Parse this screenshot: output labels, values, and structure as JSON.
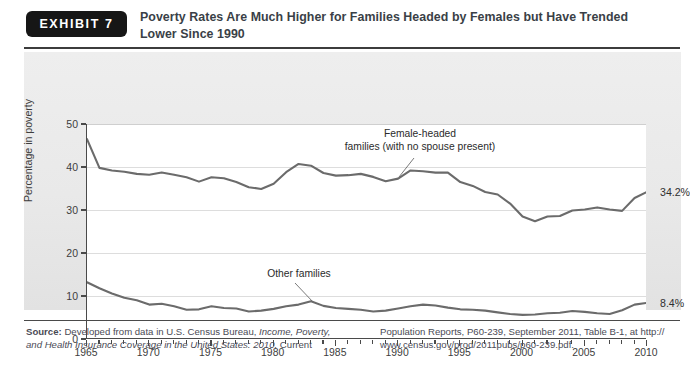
{
  "exhibit": {
    "badge_label": "EXHIBIT 7",
    "title": "Poverty Rates Are Much Higher for Families Headed by Females but Have Trended Lower Since 1990"
  },
  "source": {
    "label": "Source:",
    "left_line1_plain": " Developed from data in U.S. Census Bureau, ",
    "left_line1_italic": "Income, Poverty,",
    "left_line2_italic": "and Health Insurance Coverage in the United States: 2010,",
    "left_line2_plain": " Current",
    "right_line1": "Population Reports, P60-239, September 2011, Table B-1, at http://",
    "right_line2": "www.census.gov/prod/2011pubs/p60-239.pdf."
  },
  "chart_data": {
    "type": "line",
    "title": "Poverty Rates Are Much Higher for Families Headed by Females but Have Trended Lower Since 1990",
    "xlabel": "",
    "ylabel": "Percentage in poverty",
    "xlim": [
      1965,
      2010
    ],
    "ylim": [
      0,
      50
    ],
    "yticks": [
      0,
      10,
      20,
      30,
      40,
      50
    ],
    "xticks": [
      1965,
      1970,
      1975,
      1980,
      1985,
      1990,
      1995,
      2000,
      2005,
      2010
    ],
    "x_minor_step": 1,
    "grid": true,
    "legend": "none",
    "line_color": "#6b6b6b",
    "x": [
      1965,
      1966,
      1967,
      1968,
      1969,
      1970,
      1971,
      1972,
      1973,
      1974,
      1975,
      1976,
      1977,
      1978,
      1979,
      1980,
      1981,
      1982,
      1983,
      1984,
      1985,
      1986,
      1987,
      1988,
      1989,
      1990,
      1991,
      1992,
      1993,
      1994,
      1995,
      1996,
      1997,
      1998,
      1999,
      2000,
      2001,
      2002,
      2003,
      2004,
      2005,
      2006,
      2007,
      2008,
      2009,
      2010
    ],
    "series": [
      {
        "name": "Female-headed families (with no spouse present)",
        "annotation": "Female-headed\nfamilies (with no spouse present)",
        "end_label": "34.2%",
        "values": [
          46.5,
          39.8,
          39.2,
          38.9,
          38.4,
          38.2,
          38.7,
          38.2,
          37.6,
          36.6,
          37.6,
          37.4,
          36.5,
          35.3,
          34.9,
          36.1,
          38.8,
          40.7,
          40.3,
          38.6,
          38.0,
          38.1,
          38.4,
          37.7,
          36.7,
          37.3,
          39.2,
          39.0,
          38.7,
          38.7,
          36.5,
          35.6,
          34.2,
          33.6,
          31.5,
          28.5,
          27.4,
          28.5,
          28.6,
          29.9,
          30.1,
          30.6,
          30.1,
          29.8,
          32.8,
          34.2
        ]
      },
      {
        "name": "Other families",
        "annotation": "Other families",
        "end_label": "8.4%",
        "values": [
          13.2,
          11.8,
          10.6,
          9.6,
          9.0,
          8.0,
          8.2,
          7.6,
          6.8,
          6.9,
          7.6,
          7.2,
          7.1,
          6.4,
          6.6,
          7.0,
          7.6,
          8.0,
          8.8,
          7.7,
          7.2,
          7.0,
          6.8,
          6.4,
          6.6,
          7.1,
          7.6,
          8.0,
          7.8,
          7.3,
          6.9,
          6.8,
          6.6,
          6.2,
          5.8,
          5.6,
          5.7,
          6.0,
          6.1,
          6.5,
          6.3,
          6.0,
          5.8,
          6.7,
          8.0,
          8.4
        ]
      }
    ]
  }
}
